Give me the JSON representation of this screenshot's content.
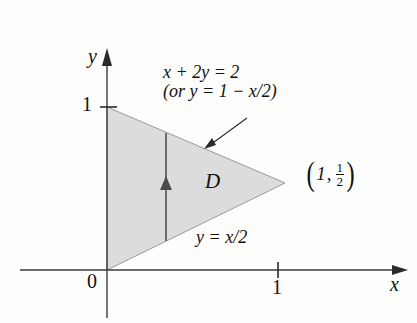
{
  "figure": {
    "background_color": "#fdfdfb",
    "region_fill_color": "#dcdcdc",
    "region_stroke_color": "#8c8c8c",
    "axis_color": "#3a3a3a",
    "text_color": "#111111"
  },
  "axes": {
    "x_label": "x",
    "y_label": "y",
    "origin_label": "0",
    "x_ticks": [
      {
        "value": 1,
        "label": "1"
      }
    ],
    "y_ticks": [
      {
        "value": 1,
        "label": "1"
      }
    ]
  },
  "region": {
    "name": "D",
    "vertices": [
      {
        "x": 0,
        "y": 0
      },
      {
        "x": 0,
        "y": 1
      },
      {
        "x": 1,
        "y": 0.5
      }
    ]
  },
  "annotations": {
    "upper_boundary": {
      "equation": "x + 2y = 2",
      "alternate_form": "(or y = 1 −  x/2)"
    },
    "lower_boundary": {
      "equation": "y = x/2"
    },
    "vertex_point": {
      "open_paren": "(",
      "x_value": "1",
      "comma": ",",
      "fraction_numerator": "1",
      "fraction_denominator": "2",
      "close_paren": ")"
    }
  }
}
